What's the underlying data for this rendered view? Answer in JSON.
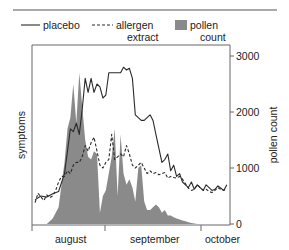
{
  "chart_data": {
    "type": "line",
    "title": "",
    "xlabel": "",
    "ylabel_left": "symptoms",
    "ylabel_right": "pollen count",
    "x_ticks": [
      "august",
      "september",
      "october"
    ],
    "y_right_ticks": [
      0,
      1000,
      2000,
      3000
    ],
    "y_right_range": [
      0,
      3000
    ],
    "grid": false,
    "legend_position": "top",
    "legend": [
      {
        "name": "placebo",
        "style": "solid-line"
      },
      {
        "name": "allergen extract",
        "style": "dashed-line"
      },
      {
        "name": "pollen count",
        "style": "filled-area",
        "color": "#8a8a8a"
      }
    ],
    "x_unit": "day index (0 = start of plot, ~early august)",
    "series": [
      {
        "name": "placebo",
        "axis": "left (scaled to right axis units)",
        "x": [
          0,
          2,
          4,
          6,
          8,
          10,
          12,
          13,
          14,
          15,
          16,
          17,
          18,
          19,
          20,
          21,
          22,
          23,
          24,
          25,
          26,
          27,
          28,
          29,
          30,
          31,
          32,
          33,
          34,
          35,
          36,
          37,
          38,
          39,
          40,
          41,
          42,
          43,
          44,
          45,
          46,
          47,
          48,
          49,
          50,
          51,
          52,
          53,
          54,
          55,
          56,
          57,
          58,
          59,
          60,
          61,
          62,
          63,
          64,
          65
        ],
        "values": [
          430,
          500,
          480,
          540,
          580,
          900,
          1700,
          1650,
          1800,
          1600,
          2050,
          2600,
          2350,
          2600,
          2350,
          2500,
          2450,
          2250,
          2300,
          2700,
          2700,
          2700,
          2700,
          2700,
          2800,
          2750,
          2780,
          2600,
          1950,
          1900,
          1850,
          1850,
          1900,
          1950,
          1850,
          1600,
          1350,
          1100,
          1150,
          1250,
          950,
          1050,
          850,
          900,
          750,
          700,
          650,
          750,
          620,
          700,
          650,
          600,
          700,
          650,
          600,
          620,
          680,
          640,
          600,
          700
        ]
      },
      {
        "name": "allergen extract",
        "axis": "left (scaled to right axis units)",
        "x": [
          0,
          1,
          2,
          3,
          4,
          5,
          6,
          7,
          8,
          9,
          10,
          11,
          12,
          13,
          14,
          15,
          16,
          17,
          18,
          19,
          20,
          21,
          22,
          23,
          24,
          25,
          26,
          27,
          28,
          29,
          30,
          31,
          32,
          33,
          34,
          35,
          36,
          37,
          38,
          39,
          40,
          41,
          42,
          43,
          44,
          45,
          46,
          47,
          48,
          49,
          50,
          51,
          52,
          53,
          54,
          55,
          56,
          57,
          58,
          59,
          60,
          61,
          62,
          63,
          64,
          65
        ],
        "values": [
          380,
          550,
          480,
          420,
          520,
          470,
          500,
          600,
          750,
          850,
          850,
          950,
          900,
          1050,
          1100,
          1100,
          1200,
          1400,
          1300,
          1450,
          1550,
          1300,
          1050,
          1000,
          1100,
          1150,
          1600,
          1150,
          1200,
          1250,
          1200,
          1400,
          1250,
          1050,
          1000,
          1050,
          1100,
          1000,
          900,
          950,
          900,
          920,
          880,
          900,
          920,
          820,
          850,
          830,
          820,
          850,
          800,
          720,
          640,
          600,
          620,
          700,
          650,
          600,
          620,
          580,
          560,
          600,
          650,
          620,
          600,
          640
        ]
      },
      {
        "name": "pollen count",
        "axis": "right",
        "x": [
          0,
          4,
          6,
          8,
          9,
          10,
          11,
          12,
          13,
          14,
          15,
          16,
          17,
          18,
          19,
          20,
          21,
          22,
          23,
          24,
          25,
          26,
          27,
          28,
          29,
          30,
          31,
          32,
          33,
          34,
          35,
          36,
          37,
          38,
          39,
          40,
          41,
          42,
          43,
          44,
          45,
          46,
          47,
          48,
          49,
          50,
          51,
          52,
          53,
          54,
          55,
          56
        ],
        "values": [
          0,
          0,
          100,
          300,
          700,
          1100,
          1700,
          1900,
          2500,
          1800,
          2700,
          2100,
          1500,
          1200,
          1150,
          1300,
          1250,
          200,
          500,
          600,
          900,
          1200,
          1700,
          500,
          1600,
          900,
          700,
          800,
          650,
          400,
          1000,
          1050,
          400,
          250,
          250,
          300,
          350,
          300,
          200,
          250,
          150,
          150,
          120,
          100,
          80,
          60,
          50,
          30,
          20,
          10,
          0,
          0
        ]
      }
    ]
  },
  "legend": {
    "placebo": "placebo",
    "allergen_line1": "allergen",
    "allergen_line2": "extract",
    "pollen_line1": "pollen",
    "pollen_line2": "count"
  },
  "axes": {
    "left_label": "symptoms",
    "right_label": "pollen count",
    "right_ticks": [
      "0",
      "1000",
      "2000",
      "3000"
    ],
    "months": [
      "august",
      "september",
      "october"
    ]
  },
  "colors": {
    "pollen_fill": "#8a8a8a",
    "line": "#2a2a2a",
    "axis": "#555555"
  }
}
